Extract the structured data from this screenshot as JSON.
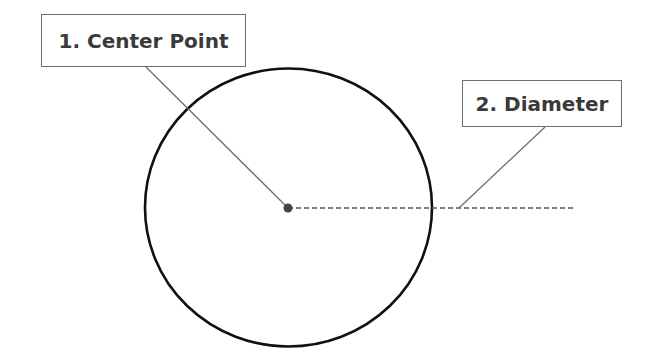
{
  "diagram": {
    "labels": [
      {
        "id": "center-point",
        "text": "1. Center Point"
      },
      {
        "id": "diameter",
        "text": "2. Diameter"
      }
    ],
    "shape": {
      "type": "circle",
      "center": [
        288,
        208
      ],
      "rx": 144,
      "ry": 139
    },
    "colors": {
      "circle_stroke": "#111111",
      "leader_line": "#6e6e6e",
      "dashed_line": "#555555",
      "center_dot": "#444444",
      "label_text": "#3a3a3a"
    }
  }
}
